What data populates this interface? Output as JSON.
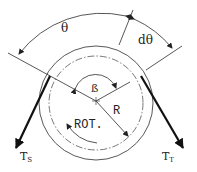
{
  "diagram": {
    "type": "belt-pulley-wrap-angle",
    "labels": {
      "theta": "θ",
      "d_theta": "dθ",
      "beta": "ß",
      "radius": "R",
      "rotation": "ROT.",
      "tension_slack": "T",
      "tension_slack_sub": "S",
      "tension_tight": "T",
      "tension_tight_sub": "T"
    },
    "colors": {
      "line": "#333333",
      "belt": "#111111",
      "background": "#ffffff"
    }
  }
}
